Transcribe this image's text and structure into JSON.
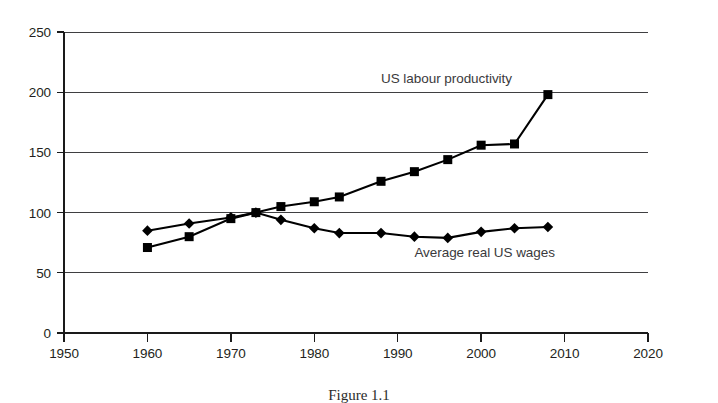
{
  "figure": {
    "caption": "Figure 1.1",
    "background_color": "#ffffff",
    "ink_color": "#000000"
  },
  "chart_data": {
    "type": "line",
    "title": "",
    "subtitle": "",
    "xlabel": "",
    "ylabel": "",
    "xlim": [
      1950,
      2020
    ],
    "ylim": [
      0,
      250
    ],
    "xticks": [
      1950,
      1960,
      1970,
      1980,
      1990,
      2000,
      2010,
      2020
    ],
    "xtick_labels": [
      "1950",
      "1960",
      "1970",
      "1980",
      "1990",
      "2000",
      "2010",
      "2020"
    ],
    "yticks": [
      0,
      50,
      100,
      150,
      200,
      250
    ],
    "ytick_labels": [
      "0",
      "50",
      "100",
      "150",
      "200",
      "250"
    ],
    "grid": true,
    "grid_axis": "y",
    "legend": "inline-annotations",
    "index_base_note": "Index, 1973 = 100",
    "series": [
      {
        "name": "US labour productivity",
        "marker": "square",
        "marker_size": 9,
        "color": "#000000",
        "label_x": 1988,
        "label_y": 208,
        "x": [
          1960,
          1965,
          1970,
          1973,
          1976,
          1980,
          1983,
          1988,
          1992,
          1996,
          2000,
          2004,
          2008
        ],
        "values": [
          71,
          80,
          95,
          100,
          105,
          109,
          113,
          126,
          134,
          144,
          156,
          157,
          198
        ]
      },
      {
        "name": "Average real US wages",
        "marker": "diamond",
        "marker_size": 9,
        "color": "#000000",
        "label_x": 1992,
        "label_y": 63,
        "x": [
          1960,
          1965,
          1970,
          1973,
          1976,
          1980,
          1983,
          1988,
          1992,
          1996,
          2000,
          2004,
          2008
        ],
        "values": [
          85,
          91,
          96,
          100,
          94,
          87,
          83,
          83,
          80,
          79,
          84,
          87,
          88
        ]
      }
    ],
    "annotations": [
      {
        "text": "US labour productivity",
        "x": 1988,
        "y": 208
      },
      {
        "text": "Average real US wages",
        "x": 1992,
        "y": 63
      }
    ]
  }
}
